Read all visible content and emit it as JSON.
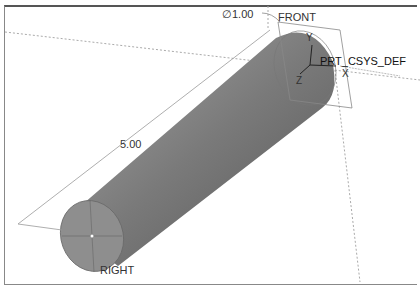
{
  "viewport": {
    "title": "3D model viewport"
  },
  "annotations": {
    "diameter": "∅1.00",
    "length": "5.00"
  },
  "datum_planes": {
    "front": "FRONT",
    "right": "RIGHT",
    "top": "TOP"
  },
  "csys": {
    "name": "PRT_CSYS_DEF",
    "axes": [
      "X",
      "Y",
      "Z"
    ]
  },
  "colors": {
    "body_light": "#9a9a9a",
    "body_dark": "#5a5a5a",
    "end_cap": "#8c8c8c",
    "datum": "#777777"
  }
}
